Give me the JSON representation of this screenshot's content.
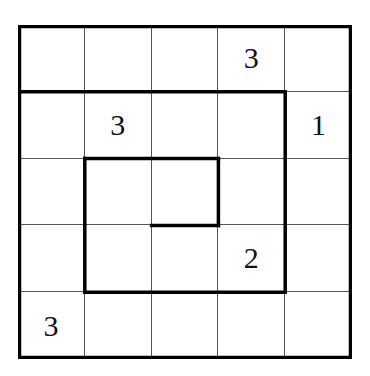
{
  "puzzle": {
    "rows": 5,
    "cols": 5,
    "cells": [
      [
        "",
        "",
        "",
        "3",
        ""
      ],
      [
        "",
        "3",
        "",
        "",
        "1"
      ],
      [
        "",
        "",
        "",
        "",
        ""
      ],
      [
        "",
        "",
        "",
        "2",
        ""
      ],
      [
        "3",
        "",
        "",
        "",
        ""
      ]
    ],
    "thick_segments": [
      {
        "from": [
          0,
          1
        ],
        "to": [
          4,
          1
        ]
      },
      {
        "from": [
          4,
          1
        ],
        "to": [
          4,
          4
        ]
      },
      {
        "from": [
          4,
          4
        ],
        "to": [
          1,
          4
        ]
      },
      {
        "from": [
          1,
          4
        ],
        "to": [
          1,
          2
        ]
      },
      {
        "from": [
          1,
          2
        ],
        "to": [
          3,
          2
        ]
      },
      {
        "from": [
          3,
          2
        ],
        "to": [
          3,
          3
        ]
      },
      {
        "from": [
          3,
          3
        ],
        "to": [
          2,
          3
        ]
      }
    ],
    "colors": {
      "grid_line": "#555555",
      "thick_line": "#000000",
      "background": "#ffffff",
      "digit": "#111111"
    }
  }
}
